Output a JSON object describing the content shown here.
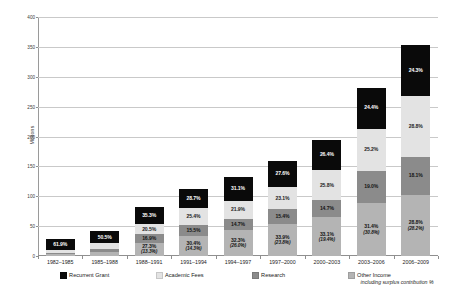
{
  "chart_data": {
    "type": "bar",
    "title": "",
    "subtitle": "",
    "stacked": true,
    "xlabel": "",
    "ylabel": "Millions",
    "ylim": [
      0,
      400
    ],
    "ytick_step": 50,
    "yticks": [
      "0",
      "50",
      "100",
      "150",
      "200",
      "250",
      "300",
      "350",
      "400"
    ],
    "grid": true,
    "legend_position": "bottom",
    "categories": [
      "1982–1985",
      "1985–1988",
      "1988–1991",
      "1991–1994",
      "1994–1997",
      "1997–2000",
      "2000–2003",
      "2003–2006",
      "2006–2009"
    ],
    "totals": [
      28,
      42,
      82,
      112,
      133,
      159,
      195,
      282,
      353
    ],
    "series": [
      {
        "name": "Other Income",
        "color": "#b4b4b4",
        "values": [
          3.5,
          6.5,
          22.4,
          34.0,
          43.0,
          53.9,
          64.5,
          88.5,
          101.7
        ],
        "labels": [
          "",
          "",
          "27.3%",
          "30.4%",
          "32.3%",
          "33.9%",
          "33.1%",
          "31.4%",
          "28.8%"
        ],
        "sublabels": [
          "",
          "",
          "(13.3%)",
          "(14.3%)",
          "(26.0%)",
          "(23.8%)",
          "(19.4%)",
          "(30.8%)",
          "(28.2%)"
        ]
      },
      {
        "name": "Research",
        "color": "#8b8b8b",
        "values": [
          2.0,
          4.5,
          13.9,
          17.4,
          19.6,
          24.5,
          28.7,
          53.6,
          63.9
        ],
        "labels": [
          "",
          "",
          "16.9%",
          "15.5%",
          "14.7%",
          "15.4%",
          "14.7%",
          "19.0%",
          "18.1%"
        ],
        "sublabels": [
          "",
          "",
          "",
          "",
          "",
          "",
          "",
          "",
          ""
        ]
      },
      {
        "name": "Academic Fees",
        "color": "#e3e3e3",
        "values": [
          5.2,
          10.0,
          16.8,
          28.4,
          29.1,
          36.7,
          50.3,
          71.1,
          101.7
        ],
        "labels": [
          "",
          "",
          "20.5%",
          "25.4%",
          "21.9%",
          "23.1%",
          "25.8%",
          "25.2%",
          "28.8%"
        ],
        "sublabels": [
          "",
          "",
          "",
          "",
          "",
          "",
          "",
          "",
          ""
        ]
      },
      {
        "name": "Recurrent Grant",
        "color": "#0a0a0a",
        "values": [
          17.3,
          21.0,
          28.9,
          32.2,
          41.4,
          43.9,
          51.5,
          68.8,
          85.8
        ],
        "labels": [
          "61.9%",
          "50.5%",
          "35.3%",
          "28.7%",
          "31.1%",
          "27.6%",
          "26.4%",
          "24.4%",
          "24.3%"
        ],
        "sublabels": [
          "",
          "",
          "",
          "",
          "",
          "",
          "",
          "",
          ""
        ]
      }
    ]
  },
  "legend": {
    "items": [
      {
        "label": "Recurrent Grant",
        "sub": "",
        "swatch": "sw-grant",
        "icon": "legend-swatch-icon"
      },
      {
        "label": "Academic Fees",
        "sub": "",
        "swatch": "sw-fees",
        "icon": "legend-swatch-icon"
      },
      {
        "label": "Research",
        "sub": "",
        "swatch": "sw-research",
        "icon": "legend-swatch-icon"
      },
      {
        "label": "Other Income",
        "sub": "including surplus contribution %",
        "swatch": "sw-other",
        "icon": "legend-swatch-icon"
      }
    ]
  },
  "axes": {
    "y_title": "Millions"
  }
}
